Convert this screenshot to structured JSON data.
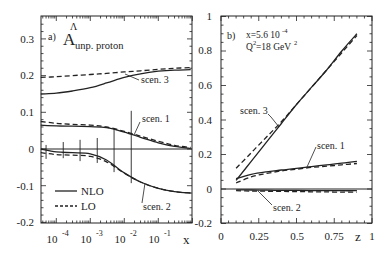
{
  "chart_data": [
    {
      "type": "line",
      "panel_label": "a)",
      "title": "A^Λ unp. proton",
      "title_main": "A",
      "title_sup": "Λ",
      "title_sub": "unp. proton",
      "xlabel": "x",
      "ylabel": "",
      "xscale": "log",
      "xlim": [
        3.5e-05,
        1
      ],
      "ylim": [
        -0.2,
        0.35
      ],
      "x_tick_labels": [
        "10^-4",
        "10^-3",
        "10^-2",
        "10^-1"
      ],
      "x_ticks": [
        0.0001,
        0.001,
        0.01,
        0.1
      ],
      "y_ticks": [
        -0.2,
        -0.1,
        0,
        0.1,
        0.2,
        0.3
      ],
      "y_tick_labels": [
        "-0.2",
        "-0.1",
        "0",
        "0.1",
        "0.2",
        "0.3"
      ],
      "legend": [
        {
          "label": "NLO",
          "style": "solid"
        },
        {
          "label": "LO",
          "style": "dashed"
        }
      ],
      "legend_position": "lower left",
      "x": [
        3.5e-05,
        0.0001,
        0.0003,
        0.001,
        0.003,
        0.01,
        0.03,
        0.1,
        0.3,
        0.9
      ],
      "series": [
        {
          "name": "scen. 3 NLO",
          "style": "solid",
          "values": [
            0.15,
            0.152,
            0.158,
            0.167,
            0.18,
            0.195,
            0.205,
            0.212,
            0.215,
            0.216
          ]
        },
        {
          "name": "scen. 3 LO",
          "style": "dashed",
          "values": [
            0.195,
            0.197,
            0.2,
            0.203,
            0.206,
            0.21,
            0.213,
            0.217,
            0.22,
            0.222
          ]
        },
        {
          "name": "scen. 1 NLO",
          "style": "solid",
          "values": [
            0.065,
            0.063,
            0.062,
            0.061,
            0.058,
            0.046,
            0.032,
            0.017,
            0.007,
            0.002
          ]
        },
        {
          "name": "scen. 1 LO",
          "style": "dashed",
          "values": [
            0.075,
            0.07,
            0.067,
            0.065,
            0.06,
            0.048,
            0.035,
            0.021,
            0.01,
            0.004
          ]
        },
        {
          "name": "scen. 2 NLO",
          "style": "solid",
          "values": [
            0.0,
            -0.008,
            -0.01,
            -0.013,
            -0.03,
            -0.065,
            -0.09,
            -0.107,
            -0.116,
            -0.12
          ]
        },
        {
          "name": "scen. 2 LO",
          "style": "dashed",
          "values": [
            -0.01,
            -0.015,
            -0.017,
            -0.02,
            -0.035,
            -0.066,
            -0.09,
            -0.107,
            -0.116,
            -0.12
          ]
        }
      ],
      "error_bars": [
        {
          "x": 5e-05,
          "low": -0.027,
          "high": 0.011
        },
        {
          "x": 0.00016,
          "low": -0.025,
          "high": 0.019
        },
        {
          "x": 0.0005,
          "low": -0.033,
          "high": 0.025
        },
        {
          "x": 0.0016,
          "low": -0.038,
          "high": 0.03
        },
        {
          "x": 0.005,
          "low": -0.063,
          "high": 0.057
        },
        {
          "x": 0.016,
          "low": -0.093,
          "high": 0.104
        }
      ],
      "annotations": [
        "scen. 3",
        "scen. 1",
        "scen. 2"
      ],
      "grid": false
    },
    {
      "type": "line",
      "panel_label": "b)",
      "title": "",
      "info_line1": "x=5.6 10^-4",
      "info_line2": "Q^2=18 GeV^2",
      "xlabel": "z",
      "ylabel": "",
      "xlim": [
        0,
        1
      ],
      "ylim": [
        -0.2,
        1
      ],
      "x_ticks": [
        0,
        0.25,
        0.5,
        0.75,
        1
      ],
      "x_tick_labels": [
        "0",
        "0.25",
        "0.5",
        "0.75",
        "1"
      ],
      "y_ticks": [
        -0.2,
        0,
        0.2,
        0.4,
        0.6,
        0.8,
        1
      ],
      "y_tick_labels": [
        "-0.2",
        "0",
        "0.2",
        "0.4",
        "0.6",
        "0.8",
        "1"
      ],
      "x": [
        0.1,
        0.2,
        0.3,
        0.4,
        0.5,
        0.6,
        0.7,
        0.8,
        0.9
      ],
      "series": [
        {
          "name": "scen. 3 NLO",
          "style": "solid",
          "values": [
            0.05,
            0.16,
            0.27,
            0.38,
            0.49,
            0.59,
            0.69,
            0.8,
            0.9
          ]
        },
        {
          "name": "scen. 3 LO",
          "style": "dashed",
          "values": [
            0.12,
            0.21,
            0.3,
            0.39,
            0.49,
            0.59,
            0.69,
            0.79,
            0.89
          ]
        },
        {
          "name": "scen. 1 NLO",
          "style": "solid",
          "values": [
            0.06,
            0.085,
            0.1,
            0.11,
            0.12,
            0.13,
            0.14,
            0.15,
            0.16
          ]
        },
        {
          "name": "scen. 1 LO",
          "style": "dashed",
          "values": [
            0.035,
            0.07,
            0.09,
            0.105,
            0.115,
            0.125,
            0.132,
            0.14,
            0.148
          ]
        },
        {
          "name": "scen. 2 NLO",
          "style": "solid",
          "values": [
            -0.005,
            -0.006,
            -0.007,
            -0.008,
            -0.008,
            -0.009,
            -0.009,
            -0.01,
            -0.01
          ]
        },
        {
          "name": "scen. 2 LO",
          "style": "dashed",
          "values": [
            -0.01,
            -0.012,
            -0.013,
            -0.014,
            -0.015,
            -0.016,
            -0.017,
            -0.018,
            -0.018
          ]
        }
      ],
      "annotations": [
        "scen. 3",
        "scen. 1",
        "scen. 2"
      ],
      "grid": false
    }
  ],
  "labels": {
    "a_panel": "a)",
    "a_title_main": "A",
    "a_title_sup": "Λ",
    "a_title_sub": "unp. proton",
    "a_xlabel": "x",
    "b_panel": "b)",
    "b_info1": "x=5.6 10",
    "b_info1_exp": "-4",
    "b_info2_pre": "Q",
    "b_info2_exp": "2",
    "b_info2_post": "=18 GeV",
    "b_info2_exp2": "2",
    "b_xlabel": "z",
    "legend_nlo": "NLO",
    "legend_lo": "LO",
    "scen3": "scen. 3",
    "scen1": "scen. 1",
    "scen2": "scen. 2",
    "a_yticks": [
      "0.3",
      "0.2",
      "0.1",
      "0",
      "-0.1",
      "-0.2"
    ],
    "a_xticks_base": "10",
    "a_xticks_exp": [
      "-4",
      "-3",
      "-2",
      "-1"
    ],
    "b_yticks": [
      "1",
      "0.8",
      "0.6",
      "0.4",
      "0.2",
      "0",
      "-0.2"
    ],
    "b_xticks": [
      "0",
      "0.25",
      "0.5",
      "0.75",
      "1"
    ]
  }
}
